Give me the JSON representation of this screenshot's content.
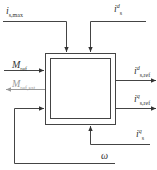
{
  "diagram": {
    "type": "block-diagram",
    "block": {
      "name": "current-reference-block",
      "label": ""
    },
    "inputs": [
      {
        "id": "is_max",
        "symbol": "i",
        "sub": "s,max",
        "sup": "",
        "direction": "top"
      },
      {
        "id": "is_d",
        "symbol": "i",
        "sub": "s",
        "sup": "d",
        "direction": "top"
      },
      {
        "id": "M_ref",
        "symbol": "M",
        "sub": "ref",
        "sup": "",
        "direction": "left"
      },
      {
        "id": "is_q",
        "symbol": "i",
        "sub": "s",
        "sup": "q",
        "direction": "bottom"
      },
      {
        "id": "omega",
        "symbol": "ω",
        "sub": "",
        "sup": "",
        "direction": "left-feedback"
      }
    ],
    "outputs": [
      {
        "id": "M_ref_sat",
        "symbol": "M",
        "sub": "ref,sat",
        "sup": "",
        "direction": "left",
        "color": "#999999"
      },
      {
        "id": "is_ref_d",
        "symbol": "i",
        "sub": "s,ref",
        "sup": "d",
        "direction": "right"
      },
      {
        "id": "is_ref_q",
        "symbol": "i",
        "sub": "s,ref",
        "sup": "q",
        "direction": "right"
      }
    ],
    "colors": {
      "line": "#444444",
      "muted": "#999999"
    }
  }
}
